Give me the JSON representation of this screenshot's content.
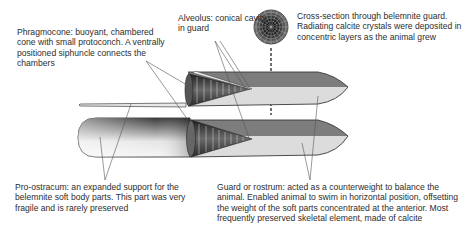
{
  "figure": {
    "labels": {
      "phragmocone": "Phragmocone: buoyant, chambered cone with small protoconch. A ventrally positioned siphuncle connects the chambers",
      "alveolus": "Alveolus: conical cavity in guard",
      "cross_section": "Cross-section through belemnite guard. Radiating calcite crystals were deposited in concentric layers as the animal grew",
      "pro_ostracum": "Pro-ostracum: an expanded support for the belemnite soft body parts. This part was very fragile and is rarely preserved",
      "guard": "Guard or rostrum: acted as a counterweight to balance the animal. Enabled animal to swim in horizontal position, offsetting the weight of the soft parts concentrated at the anterior. Most frequently preserved skeletal element, made of calcite"
    },
    "colors": {
      "guard_dark": "#7d7d7d",
      "guard_light": "#d9d9d9",
      "outline": "#3a3a3a",
      "leader": "#555555",
      "cone_dark": "#2b2b2b"
    }
  }
}
